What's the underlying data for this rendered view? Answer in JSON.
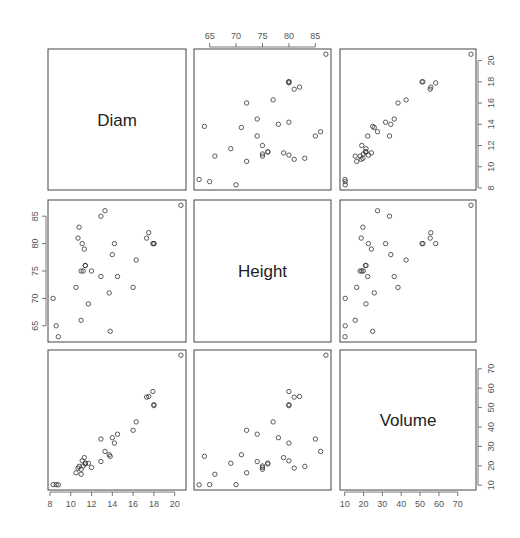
{
  "chart_data": {
    "type": "scatter",
    "subtype": "pairs-matrix",
    "title": "",
    "variables": [
      "Diam",
      "Height",
      "Volume"
    ],
    "axis_ranges": {
      "Diam": [
        7.81,
        21.09
      ],
      "Height": [
        62.04,
        87.96
      ],
      "Volume": [
        7.53,
        79.67
      ]
    },
    "ticks": {
      "Diam": [
        8,
        10,
        12,
        14,
        16,
        18,
        20
      ],
      "Height": [
        65,
        70,
        75,
        80,
        85
      ],
      "Volume": [
        10,
        20,
        30,
        40,
        50,
        60,
        70
      ]
    },
    "tick_positions": {
      "Diam": {
        "side": "bottom-col1 & right-row1"
      },
      "Height": {
        "side": "top-col2 & left-row2"
      },
      "Volume": {
        "side": "bottom-col3 & right-row3"
      }
    },
    "data": {
      "Diam": [
        8.3,
        8.6,
        8.8,
        10.5,
        10.7,
        10.8,
        11.0,
        11.0,
        11.1,
        11.2,
        11.3,
        11.4,
        11.4,
        11.7,
        12.0,
        12.9,
        12.9,
        13.3,
        13.7,
        13.8,
        14.0,
        14.2,
        14.5,
        16.0,
        16.3,
        17.3,
        17.5,
        17.9,
        18.0,
        18.0,
        20.6
      ],
      "Height": [
        70,
        65,
        63,
        72,
        81,
        83,
        66,
        75,
        80,
        75,
        79,
        76,
        76,
        69,
        75,
        74,
        85,
        86,
        71,
        64,
        78,
        80,
        74,
        72,
        77,
        81,
        82,
        80,
        80,
        80,
        87
      ],
      "Volume": [
        10.3,
        10.3,
        10.2,
        16.4,
        18.8,
        19.7,
        15.6,
        18.2,
        22.6,
        19.9,
        24.2,
        21.0,
        21.4,
        21.3,
        19.1,
        22.2,
        33.8,
        27.4,
        25.7,
        24.9,
        34.5,
        31.7,
        36.3,
        38.3,
        42.6,
        55.4,
        55.7,
        58.3,
        51.5,
        51.0,
        77.0
      ]
    },
    "marker": "open-circle",
    "grid": false,
    "legend": null
  }
}
